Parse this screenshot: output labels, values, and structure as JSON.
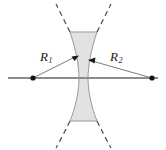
{
  "figure": {
    "labels": {
      "r1": "R",
      "r1_sub": "1",
      "r2": "R",
      "r2_sub": "2"
    },
    "colors": {
      "lens_fill": "#e2e2e2",
      "lens_outline": "#9a9a9a",
      "optical_axis": "#8c8c8c",
      "dashed_arc": "#4d4d4d",
      "leader_line": "#6b6b6b",
      "center_dot": "#111111",
      "label_text": "#1a1a1a",
      "background": "#ffffff"
    },
    "geometry": {
      "canvas_width": 166,
      "canvas_height": 150,
      "optical_axis_y": 78,
      "optical_axis_x_start": 8,
      "optical_axis_x_end": 158,
      "center_of_curvature_left": {
        "x": 33,
        "y": 78
      },
      "center_of_curvature_right": {
        "x": 152,
        "y": 78
      },
      "lens_top_y": 32,
      "lens_bottom_y": 121,
      "lens_waist_left_x": 79,
      "lens_waist_right_x": 88,
      "lens_top_left_x": 70,
      "lens_top_right_x": 97,
      "arrow_target_left": {
        "x": 76,
        "y": 58
      },
      "arrow_target_right": {
        "x": 91,
        "y": 62
      }
    }
  }
}
